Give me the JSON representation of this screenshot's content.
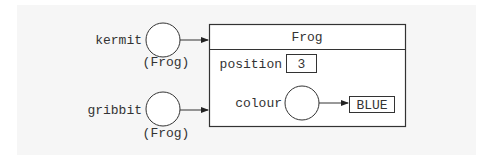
{
  "diagram": {
    "type": "object-reference-diagram",
    "references": [
      {
        "name": "kermit",
        "type_label": "(Frog)",
        "points_to": "Frog"
      },
      {
        "name": "gribbit",
        "type_label": "(Frog)",
        "points_to": "Frog"
      }
    ],
    "object": {
      "class_name": "Frog",
      "fields": [
        {
          "name": "position",
          "kind": "primitive",
          "value": "3"
        },
        {
          "name": "colour",
          "kind": "reference",
          "value": "BLUE"
        }
      ]
    },
    "colors": {
      "stroke": "#333333",
      "panel": "#f6f6f6",
      "background": "#ffffff"
    }
  }
}
